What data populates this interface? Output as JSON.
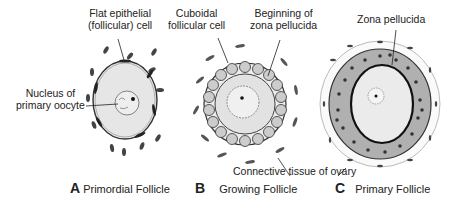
{
  "panels": [
    {
      "letter": "A",
      "title": "Primordial Follicle"
    },
    {
      "letter": "B",
      "title": "Growing Follicle"
    },
    {
      "letter": "C",
      "title": "Primary Follicle"
    }
  ],
  "labels": {
    "flat_epithelial_1": "Flat epithelial",
    "flat_epithelial_2": "(follicular) cell",
    "nucleus_1": "Nucleus of",
    "nucleus_2": "primary oocyte",
    "cuboidal_1": "Cuboidal",
    "cuboidal_2": "follicular cell",
    "beginning_1": "Beginning of",
    "beginning_2": "zona pellucida",
    "zona": "Zona pellucida",
    "connective": "Connective tissue of ovary"
  }
}
